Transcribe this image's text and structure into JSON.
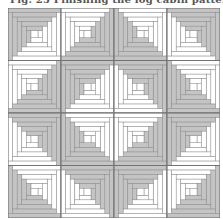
{
  "caption": "Fig. 25 Finishing the log cabin pattern",
  "quilt": {
    "rows": 4,
    "cols": 4,
    "rings": 5,
    "colors": {
      "dark": "#c4c4c4",
      "light": "#ffffff",
      "line": "#8a8a8a",
      "border": "#6e6e6e"
    },
    "dark_corner_grid": [
      [
        "TL",
        "BR",
        "BL",
        "TR"
      ],
      [
        "BR",
        "TL",
        "TR",
        "BL"
      ],
      [
        "TR",
        "BL",
        "BR",
        "TL"
      ],
      [
        "BL",
        "TR",
        "TL",
        "BR"
      ]
    ]
  }
}
